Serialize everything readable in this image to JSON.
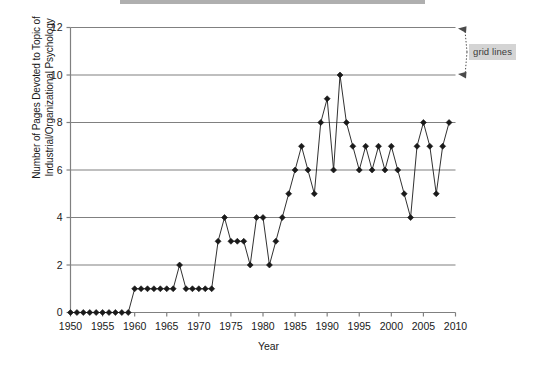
{
  "figure": {
    "ytitle": "Number of Pages Devoted to Topic of Industrial/Organizational Psychology",
    "xtitle": "Year",
    "annotation_label": "grid lines"
  },
  "chart_data": {
    "type": "line",
    "title": "",
    "subtitle": "",
    "xlabel": "Year",
    "ylabel": "Number of Pages Devoted to Topic of Industrial/Organizational Psychology",
    "xlim": [
      1950,
      2010
    ],
    "ylim": [
      0,
      12
    ],
    "ytick_values": [
      0,
      2,
      4,
      6,
      8,
      10,
      12
    ],
    "ytick_labels": [
      "0",
      "2",
      "4",
      "6",
      "8",
      "10",
      "12"
    ],
    "xtick_values": [
      1950,
      1955,
      1960,
      1965,
      1970,
      1975,
      1980,
      1985,
      1990,
      1995,
      2000,
      2005,
      2010
    ],
    "xtick_labels": [
      "1950",
      "1955",
      "1960",
      "1965",
      "1970",
      "1975",
      "1980",
      "1985",
      "1990",
      "1995",
      "2000",
      "2005",
      "2010"
    ],
    "grid": "horizontal",
    "legend": "none",
    "marker": "diamond",
    "line_color": "#1a1a1a",
    "marker_color": "#1a1a1a",
    "grid_color": "#808080",
    "axis_color": "#808080",
    "x": [
      1950,
      1951,
      1952,
      1953,
      1954,
      1955,
      1956,
      1957,
      1958,
      1959,
      1960,
      1961,
      1962,
      1963,
      1964,
      1965,
      1966,
      1967,
      1968,
      1969,
      1970,
      1971,
      1972,
      1973,
      1974,
      1975,
      1976,
      1977,
      1978,
      1979,
      1980,
      1981,
      1982,
      1983,
      1984,
      1985,
      1986,
      1987,
      1988,
      1989,
      1990,
      1991,
      1992,
      1993,
      1994,
      1995,
      1996,
      1997,
      1998,
      1999,
      2000,
      2001,
      2002,
      2003,
      2004,
      2005,
      2006,
      2007,
      2008,
      2009
    ],
    "values": [
      0,
      0,
      0,
      0,
      0,
      0,
      0,
      0,
      0,
      0,
      1,
      1,
      1,
      1,
      1,
      1,
      1,
      2,
      1,
      1,
      1,
      1,
      1,
      3,
      4,
      3,
      3,
      3,
      2,
      4,
      4,
      2,
      3,
      4,
      5,
      6,
      7,
      6,
      5,
      8,
      9,
      6,
      10,
      8,
      7,
      6,
      7,
      6,
      7,
      6,
      7,
      6,
      5,
      4,
      7,
      8,
      7,
      5,
      7,
      8
    ],
    "annotations": [
      {
        "text": "grid lines",
        "points_to": [
          "y=12 grid line",
          "y=10 grid line"
        ],
        "style": "dotted-arrow",
        "box_fill": "#d4d4d4"
      }
    ]
  }
}
